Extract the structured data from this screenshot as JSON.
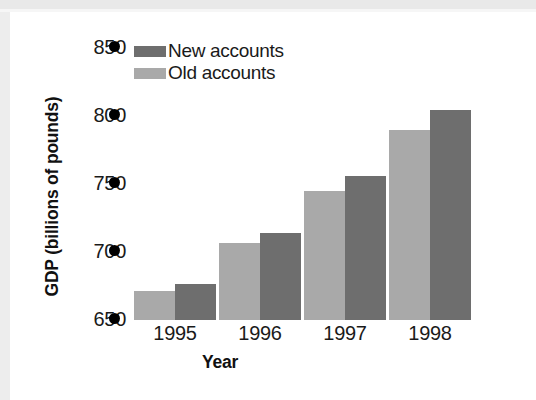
{
  "chart_data": {
    "type": "bar",
    "title": "",
    "xlabel": "Year",
    "ylabel": "GDP (billions of pounds)",
    "categories": [
      "1995",
      "1996",
      "1997",
      "1998"
    ],
    "series": [
      {
        "name": "Old accounts",
        "color": "#a9a9a9",
        "values": [
          671,
          705,
          742,
          786
        ]
      },
      {
        "name": "New accounts",
        "color": "#6e6e6e",
        "values": [
          676,
          712,
          753,
          800
        ]
      }
    ],
    "ylim": [
      650,
      850
    ],
    "yticks": [
      650,
      700,
      750,
      800,
      850
    ],
    "ytick_labels": [
      "650",
      "700",
      "750",
      "800",
      "850"
    ],
    "ytick_marker": "filled-circle",
    "grid": false,
    "legend_position": "top-left-inside",
    "bar_order_in_group": [
      "Old accounts",
      "New accounts"
    ]
  },
  "legend": {
    "items": [
      {
        "label": "New accounts",
        "swatch": "dark-gray-swatch"
      },
      {
        "label": "Old accounts",
        "swatch": "light-gray-swatch"
      }
    ]
  },
  "axes": {
    "y_title": "GDP (billions of pounds)",
    "x_title": "Year",
    "y_labels": [
      "850",
      "800",
      "750",
      "700",
      "650"
    ],
    "x_labels": [
      "1995",
      "1996",
      "1997",
      "1998"
    ]
  }
}
